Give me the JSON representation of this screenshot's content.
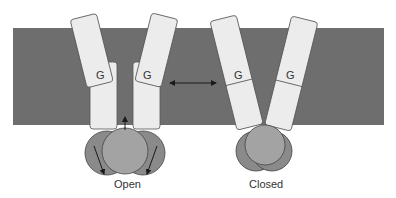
{
  "diagram": {
    "type": "ion-channel gating schematic",
    "colors": {
      "membrane": "#6e6e6e",
      "subunit_fill": "#ececec",
      "subunit_stroke": "#555555",
      "domain_dark": "#8a8a8a",
      "domain_light": "#a3a3a3",
      "arrow": "#1a1a1a"
    },
    "open_state": {
      "label": "Open",
      "subunits": [
        {
          "gate_label": "G"
        },
        {
          "gate_label": "G"
        }
      ]
    },
    "closed_state": {
      "label": "Closed",
      "subunits": [
        {
          "gate_label": "G"
        },
        {
          "gate_label": "G"
        }
      ]
    },
    "transition": "bidirectional-arrow"
  }
}
